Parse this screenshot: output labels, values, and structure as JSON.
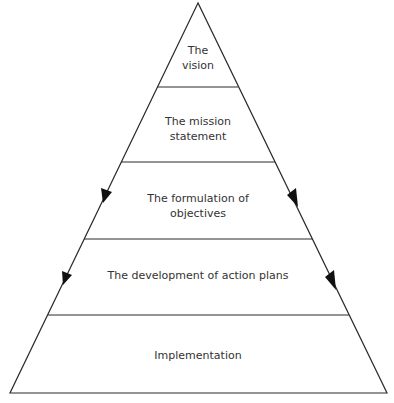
{
  "diagram": {
    "type": "pyramid",
    "colors": {
      "line": "#2a2a2a",
      "text": "#333333",
      "background": "#ffffff"
    },
    "levels": [
      {
        "line1": "The",
        "line2": "vision"
      },
      {
        "line1": "The mission",
        "line2": "statement"
      },
      {
        "line1": "The formulation of",
        "line2": "objectives"
      },
      {
        "line1": "The development of action plans",
        "line2": ""
      },
      {
        "line1": "Implementation",
        "line2": ""
      }
    ],
    "arrows": [
      {
        "side": "left",
        "level": 3
      },
      {
        "side": "right",
        "level": 3
      },
      {
        "side": "left",
        "level": 4
      },
      {
        "side": "right",
        "level": 4
      }
    ]
  }
}
